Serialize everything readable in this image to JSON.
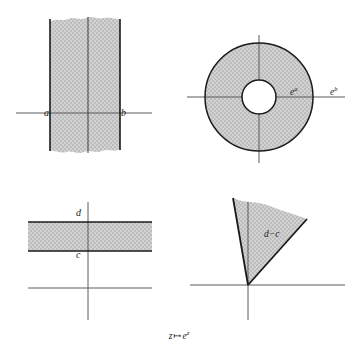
{
  "figure": {
    "caption": {
      "domain_var": "z",
      "mapsto": "↦",
      "image_base": "e",
      "image_exponent": "z"
    },
    "header_fragment": "",
    "colors": {
      "shading": "#c8c8c8",
      "stroke": "#1a1a1a",
      "axis": "#555555",
      "background": "#ffffff"
    }
  },
  "panels": {
    "vertical_strip": {
      "name": "vertical strip",
      "labels": {
        "left_bound": "a",
        "right_bound": "b"
      },
      "geometry": {
        "left_x": 50,
        "right_x": 120,
        "mid_x": 88,
        "top_y": 18,
        "bottom_y": 152,
        "axis_y": 113,
        "axis_x_start": 16,
        "axis_x_end": 152
      }
    },
    "annulus": {
      "name": "annulus",
      "labels": {
        "inner_radius": {
          "base": "e",
          "exponent": "a"
        },
        "outer_radius": {
          "base": "e",
          "exponent": "b"
        }
      },
      "geometry": {
        "center_x": 259,
        "center_y": 97,
        "outer_radius": 54,
        "inner_radius": 17,
        "axis_h_start": 187,
        "axis_h_end": 345,
        "axis_v_start": 35,
        "axis_v_end": 163
      }
    },
    "horizontal_strip": {
      "name": "horizontal strip",
      "labels": {
        "upper_bound": "d",
        "lower_bound": "c"
      },
      "geometry": {
        "top_y": 222,
        "bottom_y": 251,
        "left_x": 28,
        "right_x": 152,
        "axis_y": 288,
        "axis_v_x": 88,
        "axis_v_start": 202,
        "axis_v_end": 320
      }
    },
    "sector": {
      "name": "sector",
      "labels": {
        "angle": "d−c"
      },
      "geometry": {
        "apex_x": 248,
        "apex_y": 285,
        "axis_y": 285,
        "axis_x_start": 190,
        "axis_x_end": 345,
        "axis_v_x": 248,
        "axis_v_start": 202,
        "axis_v_end": 320,
        "radius": 88,
        "start_angle_deg": 100,
        "end_angle_deg": 62
      }
    }
  }
}
